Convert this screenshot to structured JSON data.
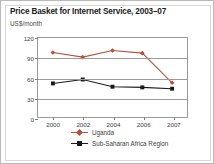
{
  "chart_data": {
    "type": "line",
    "title": "Price Basket for Internet Service, 2003–07",
    "subtitle": "",
    "xlabel": "",
    "ylabel": "US$/month",
    "categories": [
      "2000",
      "2002",
      "2004",
      "2006",
      "2007"
    ],
    "x": [
      "2000",
      "2002",
      "2004",
      "2006",
      "2007"
    ],
    "series": [
      {
        "name": "Uganda",
        "values": [
          98,
          91,
          101,
          97,
          52
        ],
        "color": "#b5513f",
        "marker": "diamond"
      },
      {
        "name": "Sub-Saharan Africa Region",
        "values": [
          51,
          57,
          46,
          45,
          43
        ],
        "color": "#1a1a1a",
        "marker": "square"
      }
    ],
    "ylim": [
      0,
      120
    ],
    "yticks": [
      0,
      30,
      60,
      90,
      120
    ],
    "ytick_labels": [
      "0",
      "30",
      "60",
      "90",
      "120"
    ],
    "grid": true,
    "legend_position": "bottom"
  },
  "colors": {
    "uganda": "#b5513f",
    "africa": "#1a1a1a",
    "axis": "#9a9a9a",
    "frame": "#b9b9b9"
  }
}
